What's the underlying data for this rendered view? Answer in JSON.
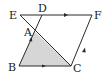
{
  "diagram": {
    "type": "geometry",
    "colors": {
      "stroke": "#2a2a2a",
      "shade": "#d6d6d6",
      "background": "#ffffff"
    },
    "points": {
      "E": {
        "label": "E",
        "x": 20,
        "y": 15
      },
      "D": {
        "label": "D",
        "x": 42,
        "y": 15
      },
      "F": {
        "label": "F",
        "x": 92,
        "y": 15
      },
      "A": {
        "label": "A",
        "x": 34,
        "y": 31
      },
      "B": {
        "label": "B",
        "x": 19,
        "y": 66
      },
      "C": {
        "label": "C",
        "x": 71,
        "y": 66
      }
    },
    "segments": [
      "EF",
      "FC",
      "CB",
      "BD",
      "EC"
    ],
    "shaded_region": "triangle ABC",
    "parallel_marks": [
      "EF",
      "BC",
      "AB",
      "CF"
    ]
  }
}
